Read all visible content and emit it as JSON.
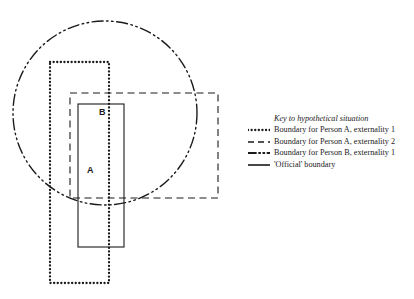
{
  "diagram": {
    "region_labels": [
      {
        "name": "label-A",
        "text": "A"
      },
      {
        "name": "label-B",
        "text": "B"
      }
    ],
    "colors": {
      "stroke": "#1a1a1a",
      "background": "#ffffff"
    },
    "shapes": [
      {
        "name": "person-a-externality-1-boundary",
        "type": "rect",
        "style": "dotted",
        "x": 50,
        "y": 62,
        "width": 59,
        "height": 221,
        "stroke_width": 2.2
      },
      {
        "name": "person-a-externality-2-boundary",
        "type": "rect",
        "style": "dashed",
        "x": 70,
        "y": 93,
        "width": 148,
        "height": 105,
        "stroke_width": 1.1
      },
      {
        "name": "person-b-externality-1-boundary",
        "type": "circle",
        "style": "dash-dot-dot",
        "cx": 105,
        "cy": 113,
        "r": 92,
        "stroke_width": 1.3
      },
      {
        "name": "official-boundary",
        "type": "rect",
        "style": "solid",
        "x": 78,
        "y": 104,
        "width": 46,
        "height": 143,
        "stroke_width": 1.1
      }
    ]
  },
  "legend": {
    "title": "Key to hypothetical situation",
    "entries": [
      {
        "swatch": "dotted-line-swatch",
        "label": "Boundary for Person A, externality 1"
      },
      {
        "swatch": "dashed-line-swatch",
        "label": "Boundary for Person A, externality 2"
      },
      {
        "swatch": "dash-dot-dot-line-swatch",
        "label": "Boundary for Person B, externality 1"
      },
      {
        "swatch": "solid-line-swatch",
        "label": "'Official' boundary"
      }
    ]
  }
}
